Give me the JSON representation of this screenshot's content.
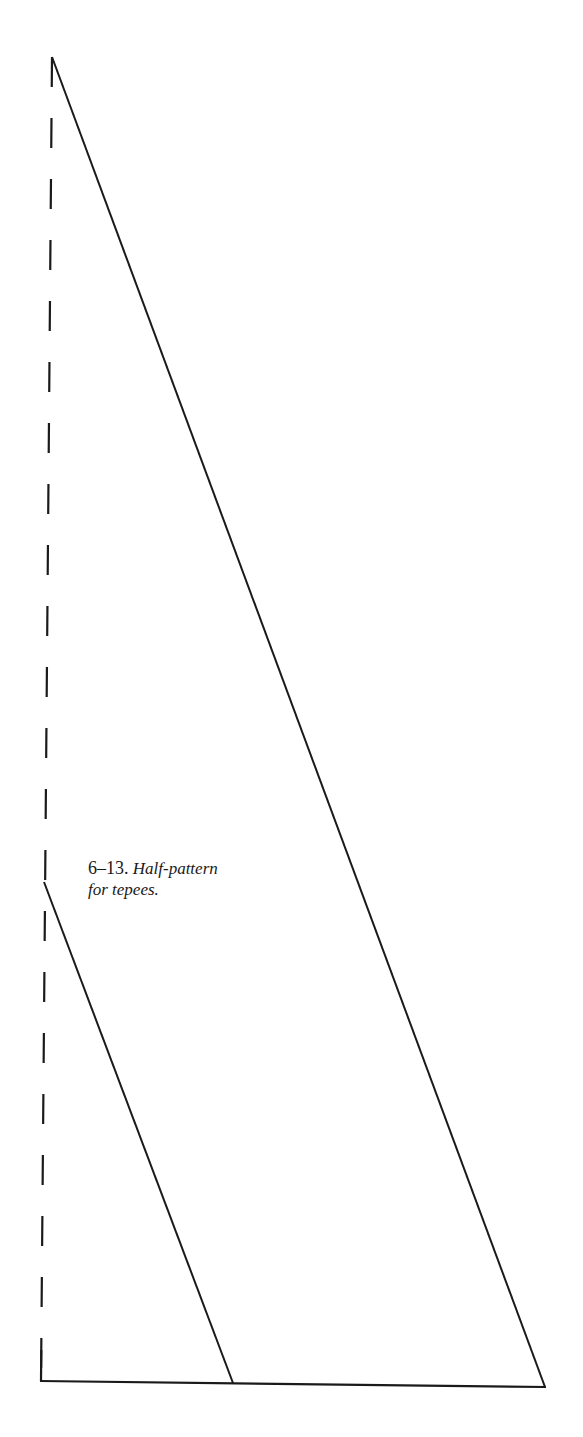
{
  "figure": {
    "number": "6–13.",
    "caption_line1": "Half-pattern",
    "caption_line2": "for tepees."
  },
  "diagram": {
    "stroke_color": "#1a1a1a",
    "fold_line": {
      "style": "dashed",
      "top": [
        52,
        57
      ],
      "bottom": [
        41,
        1381
      ]
    },
    "large_triangle": {
      "apex": [
        52,
        57
      ],
      "base_right": [
        545,
        1387
      ]
    },
    "small_triangle": {
      "apex": [
        44,
        882
      ],
      "base_right": [
        233,
        1383
      ]
    },
    "baseline": {
      "left": [
        41,
        1381
      ],
      "right": [
        545,
        1387
      ]
    }
  }
}
